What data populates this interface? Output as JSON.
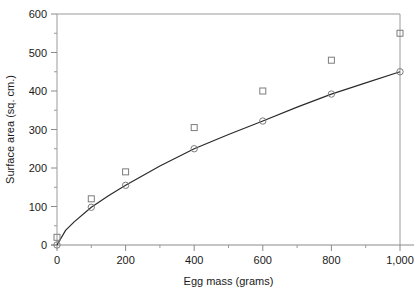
{
  "chart_data": {
    "type": "scatter",
    "title": "",
    "xlabel": "Egg mass (grams)",
    "ylabel": "Surface area (sq. cm.)",
    "xlim": [
      0,
      1000
    ],
    "ylim": [
      0,
      600
    ],
    "xticks": [
      0,
      200,
      400,
      600,
      800,
      1000
    ],
    "xtick_labels": [
      "0",
      "200",
      "400",
      "600",
      "800",
      "1,000"
    ],
    "yticks": [
      0,
      100,
      200,
      300,
      400,
      500,
      600
    ],
    "ytick_labels": [
      "0",
      "100",
      "200",
      "300",
      "400",
      "500",
      "600"
    ],
    "x_minor_step": 100,
    "y_minor_step": 50,
    "grid": false,
    "legend": "none",
    "series": [
      {
        "name": "Observed surface area",
        "marker": "open-square",
        "x": [
          0,
          100,
          200,
          400,
          600,
          800,
          1000
        ],
        "values": [
          20,
          120,
          190,
          305,
          400,
          480,
          550
        ]
      },
      {
        "name": "Fitted surface area",
        "marker": "open-circle",
        "x": [
          0,
          100,
          200,
          400,
          600,
          800,
          1000
        ],
        "values": [
          0,
          98,
          155,
          250,
          322,
          392,
          450
        ]
      }
    ],
    "fit_curve": {
      "name": "Power-law fit",
      "x": [
        0,
        25,
        50,
        100,
        150,
        200,
        300,
        400,
        500,
        600,
        700,
        800,
        900,
        1000
      ],
      "values": [
        0,
        38,
        60,
        98,
        128,
        155,
        205,
        250,
        287,
        322,
        358,
        392,
        421,
        450
      ]
    },
    "colors": {
      "curve": "#2a2a2a",
      "marker": "#7d7d7d",
      "axis": "#8a8a8a",
      "text": "#1a1a1a",
      "background": "#ffffff"
    }
  }
}
